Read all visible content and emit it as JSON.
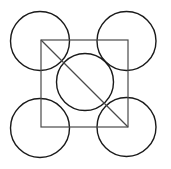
{
  "canvas": {
    "width": 171,
    "height": 169,
    "background_color": "#ffffff",
    "title": "Five circles with inscribed square and diagonal"
  },
  "style": {
    "circle_stroke_color": "#1a1a1a",
    "circle_stroke_width": 1.4,
    "square_stroke_color": "#4a4a4a",
    "square_stroke_width": 1.2,
    "diagonal_stroke_color": "#4a4a4a",
    "diagonal_stroke_width": 1.2,
    "fill": "none"
  },
  "chart_data": {
    "type": "diagram",
    "xlabel": "",
    "ylabel": "",
    "xlim": [
      0,
      171
    ],
    "ylim": [
      0,
      169
    ],
    "grid": false,
    "legend": null,
    "shapes": [
      {
        "id": "circle-top-left",
        "type": "circle",
        "cx": 40,
        "cy": 41,
        "r": 29.5,
        "stroke": "#1a1a1a",
        "stroke_width": 1.4,
        "fill": "none"
      },
      {
        "id": "circle-top-right",
        "type": "circle",
        "cx": 126.5,
        "cy": 41,
        "r": 29.5,
        "stroke": "#1a1a1a",
        "stroke_width": 1.4,
        "fill": "none"
      },
      {
        "id": "circle-bottom-left",
        "type": "circle",
        "cx": 40,
        "cy": 128,
        "r": 29.5,
        "stroke": "#1a1a1a",
        "stroke_width": 1.4,
        "fill": "none"
      },
      {
        "id": "circle-bottom-right",
        "type": "circle",
        "cx": 126.5,
        "cy": 127,
        "r": 29.5,
        "stroke": "#1a1a1a",
        "stroke_width": 1.4,
        "fill": "none"
      },
      {
        "id": "circle-center",
        "type": "circle",
        "cx": 85,
        "cy": 82,
        "r": 28.5,
        "stroke": "#1a1a1a",
        "stroke_width": 1.4,
        "fill": "none"
      },
      {
        "id": "square",
        "type": "rect",
        "x": 41,
        "y": 40,
        "width": 87,
        "height": 87,
        "stroke": "#4a4a4a",
        "stroke_width": 1.2,
        "fill": "none"
      },
      {
        "id": "diagonal",
        "type": "line",
        "x1": 41,
        "y1": 40,
        "x2": 128,
        "y2": 127,
        "stroke": "#4a4a4a",
        "stroke_width": 1.2
      }
    ]
  }
}
